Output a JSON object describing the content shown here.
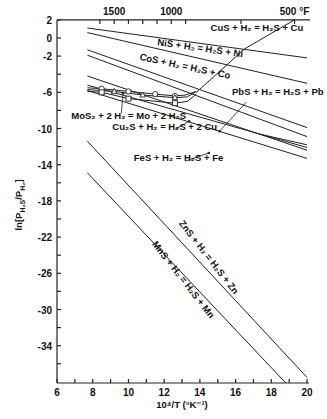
{
  "chart_data": {
    "type": "line",
    "title": "",
    "xlabel": "10⁴/T  (°K⁻¹)",
    "ylabel": "ln[P_H2S / P_H2]",
    "xlim": [
      6,
      20
    ],
    "ylim": [
      -38,
      2
    ],
    "x_ticks": [
      6,
      8,
      10,
      12,
      14,
      16,
      18,
      20
    ],
    "y_ticks": [
      2,
      0,
      -2,
      -6,
      -10,
      -14,
      -18,
      -22,
      -26,
      -30,
      -34
    ],
    "top_axis": {
      "label_unit": "°F",
      "ticks": [
        {
          "label": "1500",
          "x": 9.2
        },
        {
          "label": "1000",
          "x": 12.4
        },
        {
          "label": "500 °F",
          "x": 19.3
        }
      ]
    },
    "grid": false,
    "series": [
      {
        "name": "CuS + H₂ = H₂S + Cu",
        "points": [
          [
            7.7,
            1.1
          ],
          [
            20,
            -2.2
          ]
        ]
      },
      {
        "name": "NiS + H₂ = H₂S + Ni",
        "points": [
          [
            7.7,
            0.6
          ],
          [
            20,
            -5.0
          ]
        ]
      },
      {
        "name": "CoS + H₂ = H₂S + Co",
        "points": [
          [
            7.7,
            -1.3
          ],
          [
            20,
            -9.9
          ]
        ]
      },
      {
        "name": "unlabeled",
        "points": [
          [
            7.7,
            -1.9
          ],
          [
            20,
            -10.9
          ]
        ]
      },
      {
        "name": "PbS + H₂ = H₂S + Pb",
        "points": [
          [
            7.7,
            -4.2
          ],
          [
            20,
            -12.4
          ]
        ]
      },
      {
        "name": "Cu₂S + H₂ = H₂S + 2 Cu",
        "points": [
          [
            7.7,
            -5.2
          ],
          [
            20,
            -12.1
          ]
        ]
      },
      {
        "name": "FeS + H₂ = H₂S + Fe",
        "points": [
          [
            7.7,
            -5.8
          ],
          [
            20,
            -13.3
          ]
        ]
      },
      {
        "name": "unlabeled-short",
        "points": [
          [
            17.3,
            -10.6
          ],
          [
            20,
            -11.8
          ]
        ]
      },
      {
        "name": "MoS₂ + 2 H₂ = Mo + 2 H₂S (circles)",
        "points": [
          [
            7.7,
            -5.5
          ],
          [
            8.5,
            -5.6
          ],
          [
            10.0,
            -5.9
          ],
          [
            11.5,
            -6.2
          ],
          [
            12.6,
            -6.4
          ],
          [
            13.2,
            -6.3
          ],
          [
            13.8,
            -5.9
          ]
        ]
      },
      {
        "name": "MoS₂ + 2 H₂ = Mo + 2 H₂S (triangles)",
        "points": [
          [
            7.7,
            -5.7
          ],
          [
            9.2,
            -5.9
          ],
          [
            10.8,
            -6.3
          ],
          [
            12.6,
            -6.6
          ],
          [
            13.3,
            -6.5
          ],
          [
            13.8,
            -5.9
          ]
        ]
      },
      {
        "name": "MoS₂ + 2 H₂ = Mo + 2 H₂S (squares)",
        "points": [
          [
            7.7,
            -5.9
          ],
          [
            8.5,
            -6.0
          ],
          [
            10.0,
            -6.7
          ],
          [
            12.6,
            -7.2
          ],
          [
            13.3,
            -7.0
          ],
          [
            13.8,
            -6.2
          ]
        ]
      },
      {
        "name": "curve to 500°F",
        "points": [
          [
            13.8,
            -6.0
          ],
          [
            14.6,
            -4.6
          ],
          [
            16.5,
            -1.2
          ],
          [
            19.3,
            2.0
          ]
        ]
      },
      {
        "name": "ZnS + H₂ = H₂S + Zn",
        "points": [
          [
            7.7,
            -11.4
          ],
          [
            20,
            -37.5
          ]
        ]
      },
      {
        "name": "MnS + H₂ = H₂S + Mn",
        "points": [
          [
            7.7,
            -14.9
          ],
          [
            18.8,
            -38.1
          ]
        ]
      }
    ],
    "annotations": [
      {
        "text": "CuS + H₂ = H₂S + Cu",
        "x": 14.6,
        "y": 0.8,
        "rotate": 0
      },
      {
        "text": "NiS + H₂ = H₂S + Ni",
        "x": 11.6,
        "y": -0.8,
        "rotate": 8
      },
      {
        "text": "CoS + H₂ = H₂S + Co",
        "x": 10.6,
        "y": -2.4,
        "rotate": 12
      },
      {
        "text": "PbS + H₂ = H₂S + Pb",
        "x": 15.8,
        "y": -6.3,
        "rotate": 0
      },
      {
        "text": "MoS₂ + 2 H₂ = Mo + 2 H₂S",
        "x": 6.8,
        "y": -8.9,
        "rotate": 0
      },
      {
        "text": "Cu₂S + H₂ = H₂S + 2 Cu",
        "x": 9.1,
        "y": -10.2,
        "rotate": 0
      },
      {
        "text": "FeS + H₂ = H₂S + Fe",
        "x": 10.3,
        "y": -13.6,
        "rotate": 0
      },
      {
        "text": "ZnS + H₂ = H₂S + Zn",
        "x": 12.8,
        "y": -20.5,
        "rotate": 52
      },
      {
        "text": "MnS + H₂ = H₂S + Mn",
        "x": 11.3,
        "y": -22.8,
        "rotate": 52
      }
    ]
  }
}
